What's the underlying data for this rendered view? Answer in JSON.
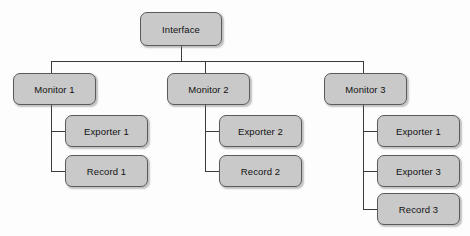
{
  "diagram": {
    "type": "tree",
    "background_color": "#fdfdfd",
    "node_fill_color": "#c9c9c9",
    "node_border_color": "#5a5a5a",
    "edge_color": "#3a3a3a",
    "text_color": "#111111",
    "nodes": {
      "root": {
        "label": "Interface"
      },
      "monitor1": {
        "label": "Monitor 1"
      },
      "monitor2": {
        "label": "Monitor 2"
      },
      "monitor3": {
        "label": "Monitor 3"
      },
      "m1_child1": {
        "label": "Exporter 1"
      },
      "m1_child2": {
        "label": "Record 1"
      },
      "m2_child1": {
        "label": "Exporter 2"
      },
      "m2_child2": {
        "label": "Record 2"
      },
      "m3_child1": {
        "label": "Exporter 1"
      },
      "m3_child2": {
        "label": "Exporter 3"
      },
      "m3_child3": {
        "label": "Record 3"
      }
    },
    "hierarchy": [
      {
        "label": "Interface",
        "children": [
          {
            "label": "Monitor 1",
            "children": [
              {
                "label": "Exporter 1"
              },
              {
                "label": "Record 1"
              }
            ]
          },
          {
            "label": "Monitor 2",
            "children": [
              {
                "label": "Exporter 2"
              },
              {
                "label": "Record 2"
              }
            ]
          },
          {
            "label": "Monitor 3",
            "children": [
              {
                "label": "Exporter 1"
              },
              {
                "label": "Exporter 3"
              },
              {
                "label": "Record 3"
              }
            ]
          }
        ]
      }
    ]
  }
}
